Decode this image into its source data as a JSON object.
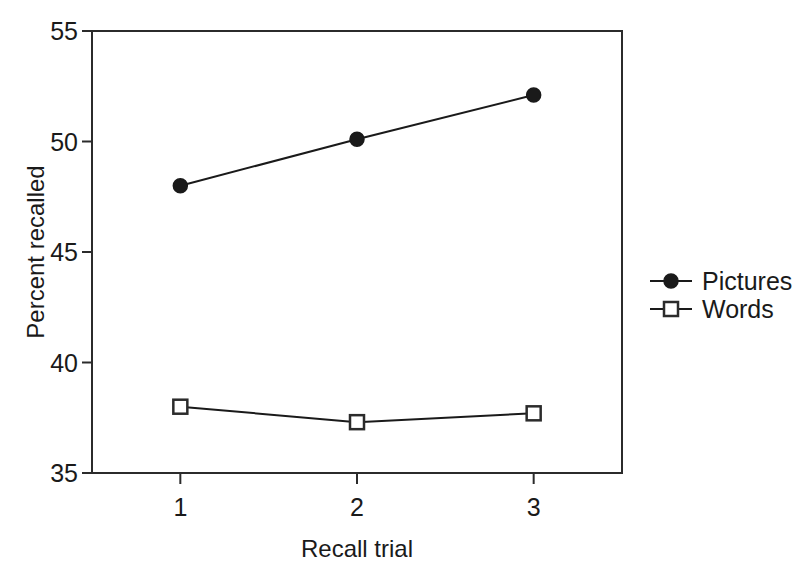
{
  "chart_data": {
    "type": "line",
    "title": "",
    "xlabel": "Recall trial",
    "ylabel": "Percent recalled",
    "categories": [
      "1",
      "2",
      "3"
    ],
    "x": [
      1,
      2,
      3
    ],
    "xlim": [
      0.5,
      3.5
    ],
    "ylim": [
      35,
      55
    ],
    "yticks": [
      35,
      40,
      45,
      50,
      55
    ],
    "ytick_labels": [
      "35",
      "40",
      "45",
      "50",
      "55"
    ],
    "xticks": [
      1,
      2,
      3
    ],
    "xtick_labels": [
      "1",
      "2",
      "3"
    ],
    "grid": false,
    "legend_position": "right",
    "series": [
      {
        "name": "Pictures",
        "marker": "filled-circle",
        "color": "#1a1a1a",
        "values": [
          48.0,
          50.1,
          52.1
        ]
      },
      {
        "name": "Words",
        "marker": "open-square",
        "color": "#2b2b2b",
        "values": [
          38.0,
          37.3,
          37.7
        ]
      }
    ]
  },
  "legend": {
    "items": [
      {
        "label": "Pictures",
        "marker": "filled-circle"
      },
      {
        "label": "Words",
        "marker": "open-square"
      }
    ]
  }
}
